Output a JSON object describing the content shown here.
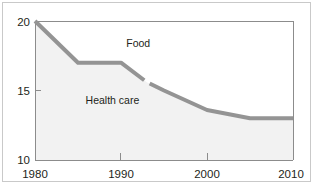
{
  "figure": {
    "clipped_caption": "",
    "frame_color": "#c9c9c9",
    "background": "#ffffff"
  },
  "chart_data": {
    "type": "line",
    "title": "",
    "xlabel": "",
    "ylabel": "",
    "xlim": [
      1980,
      2010
    ],
    "ylim": [
      10,
      20
    ],
    "xticks": [
      1980,
      1990,
      2000,
      2010
    ],
    "xtick_labels": [
      "1980",
      "1990",
      "2000",
      "2010"
    ],
    "yticks": [
      10,
      15,
      20
    ],
    "ytick_labels": [
      "10",
      "15",
      "20"
    ],
    "grid": false,
    "legend_position": "inline-annotations",
    "line_color": "#949494",
    "fill_color": "#f2f2f2",
    "series": [
      {
        "name": "Food",
        "label_text": "Food",
        "label_x": 1992,
        "label_y": 18.1,
        "x": [
          1980,
          1985,
          1990,
          1993,
          1995,
          2000,
          2005,
          2010
        ],
        "values": [
          20.0,
          17.0,
          17.0,
          15.6,
          15.0,
          13.6,
          13.0,
          13.0
        ]
      }
    ],
    "annotations": [
      {
        "name": "Food",
        "text": "Food",
        "x": 1992,
        "y": 18.1
      },
      {
        "name": "Health care",
        "text": "Health care",
        "x": 1989,
        "y": 14.0
      }
    ]
  }
}
